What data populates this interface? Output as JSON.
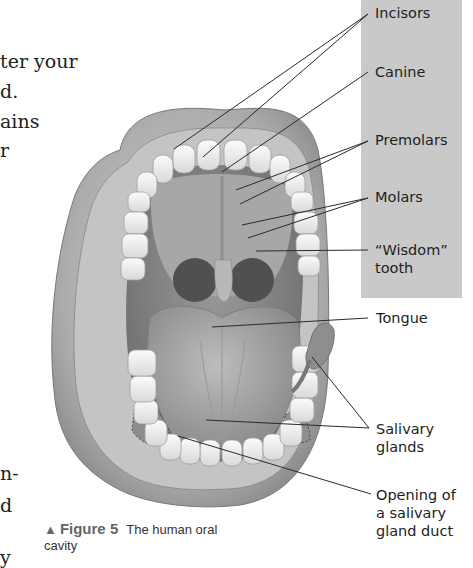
{
  "body_text_fragments": [
    {
      "text": "ter your",
      "top": 52,
      "left": 0
    },
    {
      "text": "d.",
      "top": 82,
      "left": 0
    },
    {
      "text": "ains",
      "top": 112,
      "left": 0
    },
    {
      "text": "r",
      "top": 141,
      "left": 0
    },
    {
      "text": "n-",
      "top": 464,
      "left": 0
    },
    {
      "text": "d",
      "top": 496,
      "left": 0
    },
    {
      "text": "y",
      "top": 548,
      "left": 0
    }
  ],
  "labels": {
    "incisors": "Incisors",
    "canine": "Canine",
    "premolars": "Premolars",
    "molars": "Molars",
    "wisdom_line1": "“Wisdom”",
    "wisdom_line2": "tooth",
    "tongue": "Tongue",
    "salivary_line1": "Salivary",
    "salivary_line2": "glands",
    "opening_line1": "Opening of",
    "opening_line2": "a salivary",
    "opening_line3": "gland duct"
  },
  "caption": {
    "marker": "▲",
    "figure": "Figure 5",
    "text": "The human oral cavity"
  },
  "colors": {
    "label_panel": "#c9c9c9",
    "leader_line": "#2a2a2a",
    "caption_figure": "#666666"
  }
}
